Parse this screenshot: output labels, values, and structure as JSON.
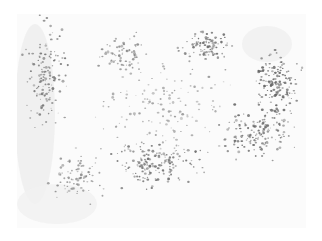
{
  "image": {
    "description": "Grayscale histology micrograph showing scattered stained cell nuclei on a pale tissue background",
    "background": "#fbfbfb",
    "dot_color": "#6f6f6f",
    "frame": {
      "x": 17,
      "y": 14,
      "width": 289,
      "height": 214
    },
    "clusters": [
      {
        "cx": 30,
        "cy": 60,
        "rx": 26,
        "ry": 70,
        "n": 140,
        "shade": "#777777"
      },
      {
        "cx": 110,
        "cy": 40,
        "rx": 40,
        "ry": 25,
        "n": 70,
        "shade": "#8a8a8a"
      },
      {
        "cx": 190,
        "cy": 30,
        "rx": 35,
        "ry": 20,
        "n": 90,
        "shade": "#707070"
      },
      {
        "cx": 260,
        "cy": 70,
        "rx": 30,
        "ry": 40,
        "n": 150,
        "shade": "#666666"
      },
      {
        "cx": 240,
        "cy": 120,
        "rx": 45,
        "ry": 35,
        "n": 160,
        "shade": "#6a6a6a"
      },
      {
        "cx": 140,
        "cy": 150,
        "rx": 60,
        "ry": 30,
        "n": 170,
        "shade": "#707070"
      },
      {
        "cx": 60,
        "cy": 160,
        "rx": 35,
        "ry": 35,
        "n": 80,
        "shade": "#888888"
      },
      {
        "cx": 150,
        "cy": 90,
        "rx": 90,
        "ry": 60,
        "n": 140,
        "shade": "#9a9a9a"
      }
    ],
    "faint_regions": [
      {
        "cx": 18,
        "cy": 100,
        "rx": 20,
        "ry": 90,
        "shade": "#eeeeee"
      },
      {
        "cx": 40,
        "cy": 190,
        "rx": 40,
        "ry": 20,
        "shade": "#f1f1f1"
      },
      {
        "cx": 250,
        "cy": 30,
        "rx": 25,
        "ry": 18,
        "shade": "#f0f0f0"
      }
    ]
  }
}
